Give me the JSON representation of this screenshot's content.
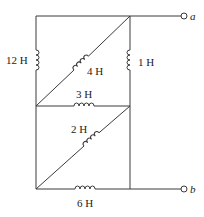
{
  "diagram": {
    "type": "inductor-circuit",
    "terminals": [
      {
        "id": "a",
        "label": "a"
      },
      {
        "id": "b",
        "label": "b"
      }
    ],
    "inductors": [
      {
        "id": "L12",
        "label": "12 H",
        "value_h": 12,
        "position": "left-upper-vertical"
      },
      {
        "id": "L4",
        "label": "4 H",
        "value_h": 4,
        "position": "upper-diagonal"
      },
      {
        "id": "L1",
        "label": "1 H",
        "value_h": 1,
        "position": "right-upper-vertical"
      },
      {
        "id": "L3",
        "label": "3 H",
        "value_h": 3,
        "position": "middle-horizontal"
      },
      {
        "id": "L2",
        "label": "2 H",
        "value_h": 2,
        "position": "lower-diagonal"
      },
      {
        "id": "L6",
        "label": "6 H",
        "value_h": 6,
        "position": "bottom-horizontal"
      }
    ]
  }
}
